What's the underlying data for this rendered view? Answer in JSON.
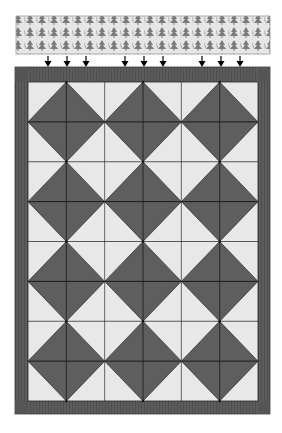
{
  "diagram": {
    "fabric_strip": {
      "print": "pine-tree",
      "background_color": "#e6e6e6",
      "motif_color": "#7a7a7a"
    },
    "arrows": {
      "groups": 3,
      "per_group": 3,
      "color": "#000000",
      "direction": "down"
    },
    "quilt": {
      "border_color": "#5c5c5c",
      "border_stripe_color": "#4e4e4e",
      "light_color": "#e8e8e8",
      "dark_color": "#5e5e5e",
      "grid_line_color": "#1a1a1a",
      "grid_columns": 6,
      "grid_rows": 8,
      "diamond_columns": 3,
      "diamond_rows": 4
    }
  }
}
